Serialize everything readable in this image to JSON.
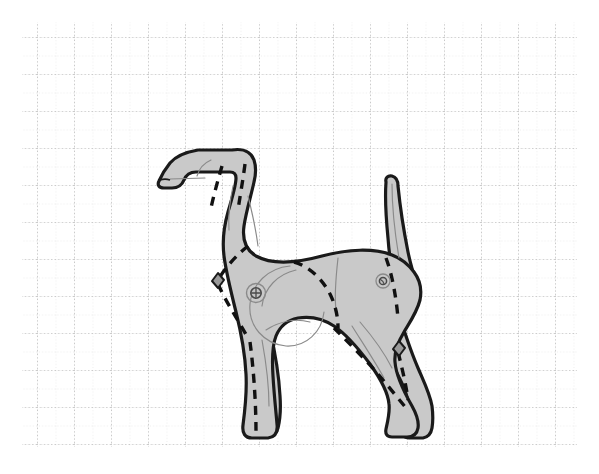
{
  "document": {
    "title": "Dog Body Pattern Diagram",
    "subject": "dog-side-profile",
    "orientation": "facing-left",
    "view": "lateral-left"
  },
  "canvas": {
    "width": 599,
    "height": 474,
    "background_color": "#ffffff"
  },
  "grid": {
    "visible": true,
    "style": "dotted",
    "origin_x": 22,
    "origin_y": 22,
    "end_x": 577,
    "end_y": 447,
    "minor_spacing": 18.5,
    "major_spacing": 37,
    "minor_color": "#d8d8d8",
    "major_color": "#a8a8a8",
    "minor_columns": 30,
    "minor_rows": 23
  },
  "figure": {
    "name": "dog-silhouette",
    "fill_color": "#c9c9c9",
    "outline_color": "#1a1a1a",
    "outline_width": 3.2,
    "interior_line_color": "#8a8a8a",
    "interior_line_width": 1.1,
    "seam_color": "#111111",
    "seam_width": 3.4,
    "seam_dash": "9 7"
  },
  "parts": [
    {
      "id": "head",
      "label": "Head"
    },
    {
      "id": "muzzle",
      "label": "Muzzle"
    },
    {
      "id": "ear",
      "label": "Ear"
    },
    {
      "id": "neck",
      "label": "Neck"
    },
    {
      "id": "back",
      "label": "Back"
    },
    {
      "id": "chest",
      "label": "Chest"
    },
    {
      "id": "belly",
      "label": "Belly"
    },
    {
      "id": "shoulder",
      "label": "Shoulder"
    },
    {
      "id": "hip",
      "label": "Hip"
    },
    {
      "id": "tail",
      "label": "Tail"
    },
    {
      "id": "foreleg-near",
      "label": "Near Foreleg"
    },
    {
      "id": "foreleg-far",
      "label": "Far Foreleg"
    },
    {
      "id": "hindleg-near",
      "label": "Near Hindleg"
    },
    {
      "id": "hindleg-far",
      "label": "Far Hindleg"
    }
  ],
  "hardware": [
    {
      "id": "shoulder-joint-screw",
      "label": "Shoulder Joint Screw",
      "cx": 256,
      "cy": 293,
      "outer_radius": 9.5,
      "inner_radius": 5.2,
      "type": "slotted-ring"
    },
    {
      "id": "hip-joint-screw",
      "label": "Hip Joint Screw",
      "cx": 383,
      "cy": 281,
      "outer_radius": 7.0,
      "inner_radius": 3.6,
      "type": "slotted-ring"
    },
    {
      "id": "shoulder-diamond-slot",
      "label": "Shoulder Diamond Slot",
      "cx": 218,
      "cy": 280,
      "size": 9,
      "type": "diamond-cutout"
    },
    {
      "id": "hindleg-diamond-slot",
      "label": "Hindleg Diamond Slot",
      "cx": 399,
      "cy": 348,
      "size": 9,
      "type": "diamond-cutout"
    }
  ],
  "seams": [
    {
      "id": "seam-head-front",
      "label": "Head Front Seam"
    },
    {
      "id": "seam-head-back",
      "label": "Head Back Seam"
    },
    {
      "id": "seam-shoulder",
      "label": "Shoulder Seam"
    },
    {
      "id": "seam-foreleg",
      "label": "Foreleg Seam"
    },
    {
      "id": "seam-flank",
      "label": "Flank Seam"
    },
    {
      "id": "seam-hip",
      "label": "Hip Seam"
    },
    {
      "id": "seam-hindleg-near",
      "label": "Near Hindleg Seam"
    },
    {
      "id": "seam-hindleg-far",
      "label": "Far Hindleg Seam"
    }
  ]
}
